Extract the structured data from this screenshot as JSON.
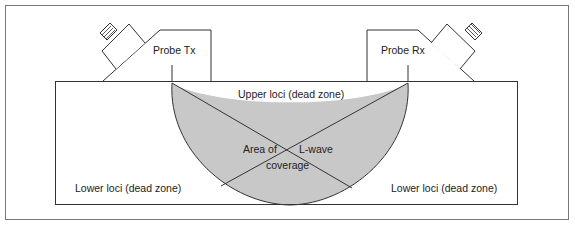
{
  "diagram": {
    "type": "ultrasonic TOFD probe arrangement",
    "colors": {
      "line": "#333333",
      "coverage_fill": "#c8c8c8",
      "frame": "#666666",
      "background": "#ffffff"
    },
    "labels": {
      "probe_tx": "Probe Tx",
      "probe_rx": "Probe Rx",
      "upper_loci": "Upper loci (dead zone)",
      "area_of": "Area of",
      "coverage": "coverage",
      "l_wave": "L-wave",
      "lower_loci_left": "Lower loci (dead zone)",
      "lower_loci_right": "Lower loci (dead zone)"
    },
    "nodes": [
      {
        "id": "probe-tx",
        "label": "Probe Tx"
      },
      {
        "id": "probe-rx",
        "label": "Probe Rx"
      },
      {
        "id": "test-block",
        "label": ""
      },
      {
        "id": "coverage-area",
        "label": "Area of coverage"
      },
      {
        "id": "upper-dead-zone",
        "label": "Upper loci (dead zone)"
      },
      {
        "id": "lower-dead-zone-left",
        "label": "Lower loci (dead zone)"
      },
      {
        "id": "lower-dead-zone-right",
        "label": "Lower loci (dead zone)"
      }
    ],
    "edges": [
      {
        "from": "probe-tx",
        "to": "coverage-area",
        "label": "L-wave"
      },
      {
        "from": "probe-rx",
        "to": "coverage-area",
        "label": "L-wave"
      }
    ]
  }
}
